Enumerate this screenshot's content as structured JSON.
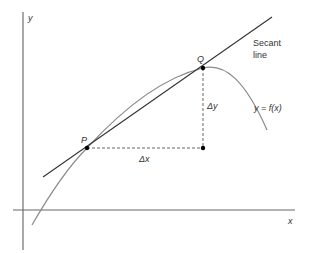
{
  "diagram": {
    "axes": {
      "x_label": "x",
      "y_label": "y"
    },
    "points": [
      {
        "label": "P",
        "x": 87,
        "y": 148
      },
      {
        "label": "Q",
        "x": 203,
        "y": 68
      }
    ],
    "secant": {
      "label_line1": "Secant",
      "label_line2": "line"
    },
    "curve": {
      "label": "y = f(x)"
    },
    "increments": {
      "dx_label": "Δx",
      "dy_label": "Δy"
    },
    "colors": {
      "axis": "#555555",
      "curve": "#888888",
      "secant": "#333333",
      "dashed": "#555555",
      "point": "#000000",
      "text": "#333333"
    }
  }
}
